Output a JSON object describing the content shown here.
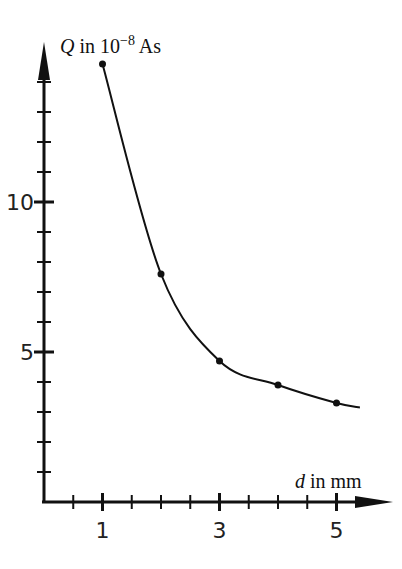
{
  "chart_data": {
    "type": "line",
    "title": "",
    "xlabel_var": "d",
    "xlabel_unit": " in mm",
    "ylabel_var": "Q",
    "ylabel_unit": " in 10",
    "ylabel_exp": "−8",
    "ylabel_unit2": " As",
    "xlim": [
      0,
      5.6
    ],
    "ylim": [
      0,
      15
    ],
    "x_tick_labels": [
      "1",
      "3",
      "5"
    ],
    "y_tick_labels": [
      "5",
      "10"
    ],
    "x_minor_step": 0.5,
    "y_minor_step": 1,
    "grid": false,
    "series": [
      {
        "name": "measured",
        "points": [
          {
            "x": 1,
            "y": 14.6
          },
          {
            "x": 2,
            "y": 7.6
          },
          {
            "x": 3,
            "y": 4.7
          },
          {
            "x": 4,
            "y": 3.9
          },
          {
            "x": 5,
            "y": 3.3
          }
        ]
      }
    ],
    "fit_curve": "smooth hyperbolic decay through points, ending near d=5.4, Q=3.15"
  }
}
